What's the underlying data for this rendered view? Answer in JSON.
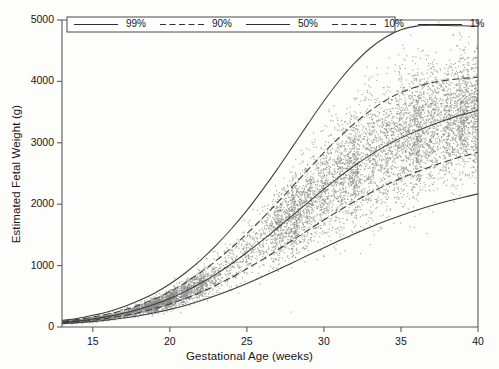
{
  "chart_data": {
    "type": "line",
    "title": "",
    "xlabel": "Gestational Age (weeks)",
    "ylabel": "Estimated Fetal Weight (g)",
    "xlim": [
      13,
      40
    ],
    "ylim": [
      0,
      5000
    ],
    "xticks": [
      15,
      20,
      25,
      30,
      35,
      40
    ],
    "yticks": [
      0,
      1000,
      2000,
      3000,
      4000,
      5000
    ],
    "grid": false,
    "legend_position": "top-left-inside",
    "legend_entries": [
      {
        "label": "99%",
        "style": "solid"
      },
      {
        "label": "90%",
        "style": "dashed"
      },
      {
        "label": "50%",
        "style": "solid"
      },
      {
        "label": "10%",
        "style": "dashed"
      },
      {
        "label": "1%",
        "style": "solid"
      }
    ],
    "x": [
      13,
      14,
      15,
      16,
      17,
      18,
      19,
      20,
      21,
      22,
      23,
      24,
      25,
      26,
      27,
      28,
      29,
      30,
      31,
      32,
      33,
      34,
      35,
      36,
      37,
      38,
      39,
      40
    ],
    "series": [
      {
        "name": "99%",
        "style": "solid",
        "values": [
          110,
          140,
          190,
          250,
          330,
          430,
          550,
          700,
          880,
          1090,
          1330,
          1600,
          1900,
          2230,
          2580,
          2950,
          3320,
          3680,
          4010,
          4300,
          4540,
          4720,
          4840,
          4900,
          4915,
          4910,
          4905,
          4900
        ]
      },
      {
        "name": "90%",
        "style": "dashed",
        "values": [
          95,
          120,
          160,
          210,
          275,
          355,
          455,
          575,
          720,
          890,
          1080,
          1290,
          1520,
          1770,
          2030,
          2300,
          2570,
          2840,
          3090,
          3320,
          3520,
          3690,
          3820,
          3910,
          3980,
          4020,
          4050,
          4070
        ]
      },
      {
        "name": "50%",
        "style": "solid",
        "values": [
          80,
          100,
          132,
          173,
          225,
          290,
          370,
          465,
          580,
          712,
          862,
          1030,
          1213,
          1410,
          1615,
          1825,
          2035,
          2245,
          2445,
          2630,
          2800,
          2950,
          3080,
          3190,
          3290,
          3380,
          3460,
          3530
        ]
      },
      {
        "name": "10%",
        "style": "dashed",
        "values": [
          68,
          85,
          110,
          143,
          185,
          237,
          300,
          375,
          463,
          565,
          680,
          808,
          948,
          1098,
          1255,
          1418,
          1580,
          1742,
          1898,
          2045,
          2182,
          2308,
          2422,
          2525,
          2618,
          2702,
          2778,
          2845
        ]
      },
      {
        "name": "1%",
        "style": "solid",
        "values": [
          55,
          68,
          88,
          113,
          145,
          184,
          231,
          287,
          352,
          427,
          512,
          606,
          708,
          818,
          933,
          1052,
          1172,
          1292,
          1408,
          1520,
          1626,
          1725,
          1816,
          1900,
          1977,
          2047,
          2110,
          2168
        ]
      }
    ],
    "scatter": {
      "marker": "point",
      "color": "#8a8a8a",
      "note": "Individual estimated fetal weight observations clustered at discrete scan weeks",
      "cluster_weeks": [
        13,
        14,
        15,
        16,
        17,
        18,
        19,
        20,
        21,
        22,
        23,
        24,
        25,
        26,
        27,
        28,
        29,
        30,
        31,
        32,
        33,
        34,
        35,
        36,
        37,
        38,
        39,
        40
      ],
      "dense_cluster_weeks": [
        19,
        20,
        28,
        32,
        36,
        39,
        40
      ]
    }
  }
}
